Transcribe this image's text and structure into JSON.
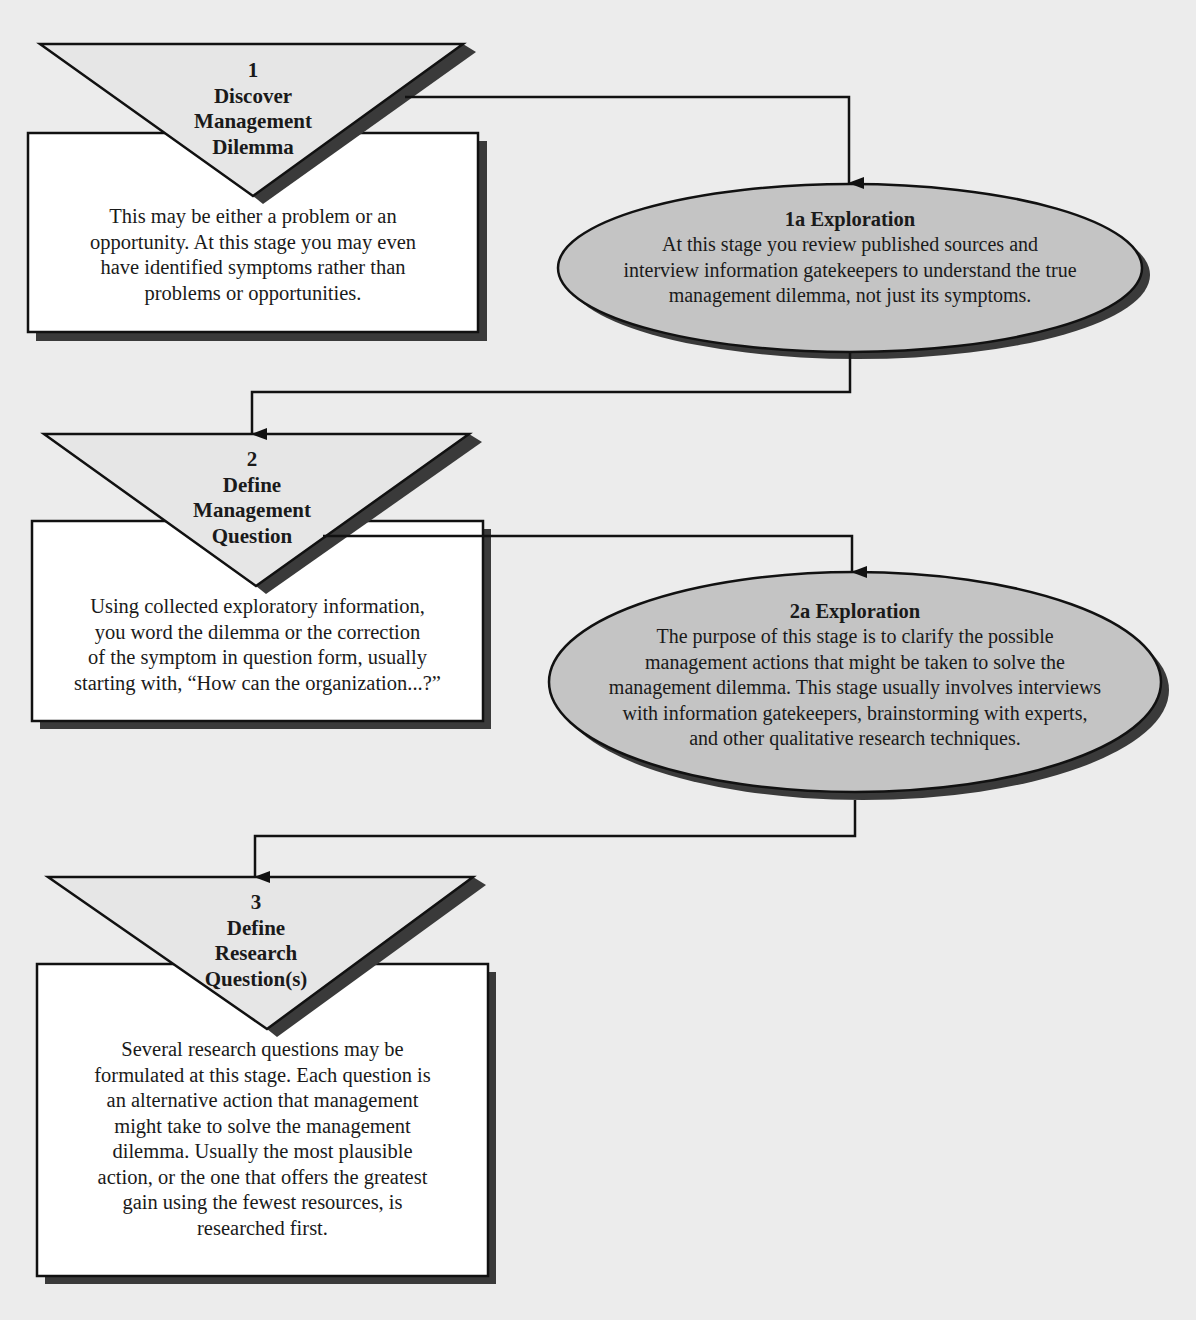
{
  "diagram": {
    "colors": {
      "background": "#ececec",
      "box_fill": "#ffffff",
      "triangle_fill": "#e6e6e6",
      "ellipse_fill": "#c4c4c4",
      "shadow": "#3a3a3a",
      "stroke": "#111111"
    },
    "steps": [
      {
        "number": "1",
        "title_lines": [
          "Discover",
          "Management",
          "Dilemma"
        ],
        "body_lines": [
          "This may be either a problem or an",
          "opportunity.  At this stage you may even",
          "have identified symptoms rather than",
          "problems or opportunities."
        ]
      },
      {
        "number": "2",
        "title_lines": [
          "Define",
          "Management",
          "Question"
        ],
        "body_lines": [
          "Using collected exploratory information,",
          "you word the dilemma or the correction",
          "of the symptom in question form, usually",
          "starting with, “How can the organization...?”"
        ]
      },
      {
        "number": "3",
        "title_lines": [
          "Define",
          "Research",
          "Question(s)"
        ],
        "body_lines": [
          "Several research questions may be",
          "formulated at this stage.  Each question is",
          "an alternative action that management",
          "might take to solve the management",
          "dilemma.  Usually the most plausible",
          "action, or the one that offers the greatest",
          "gain using the fewest resources, is",
          "researched first."
        ]
      }
    ],
    "explorations": [
      {
        "title": "1a Exploration",
        "body_lines": [
          "At this stage you review published sources and",
          "interview information gatekeepers to understand the true",
          "management dilemma, not just its symptoms."
        ]
      },
      {
        "title": "2a Exploration",
        "body_lines": [
          "The purpose of this stage is to clarify the possible",
          "management actions that might be taken to solve the",
          "management dilemma.  This stage usually involves interviews",
          "with information gatekeepers, brainstorming with experts,",
          "and other qualitative research techniques."
        ]
      }
    ],
    "connectors": [
      {
        "from": "step-1",
        "to": "exploration-1a"
      },
      {
        "from": "exploration-1a",
        "to": "step-2"
      },
      {
        "from": "step-2",
        "to": "exploration-2a"
      },
      {
        "from": "exploration-2a",
        "to": "step-3"
      }
    ]
  }
}
